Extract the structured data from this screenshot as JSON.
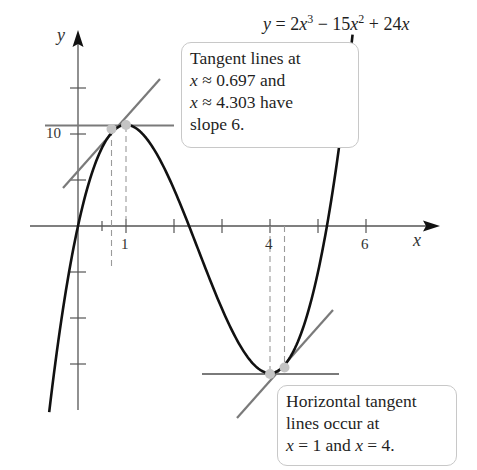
{
  "chart_data": {
    "type": "line",
    "equation_display": {
      "prefix": "y = 2x",
      "exp1": "3",
      "mid": " − 15x",
      "exp2": "2",
      "suffix": " + 24x"
    },
    "xlabel": "x",
    "ylabel": "y",
    "xlim": [
      -1,
      7.3
    ],
    "ylim": [
      -20,
      21
    ],
    "x_ticks": [
      0.5,
      1,
      2,
      3,
      4,
      5,
      6
    ],
    "x_tick_labels": [
      {
        "value": 1,
        "label": "1"
      },
      {
        "value": 4,
        "label": "4"
      },
      {
        "value": 6,
        "label": "6"
      }
    ],
    "y_ticks": [
      -15,
      -10,
      -5,
      5,
      10,
      15
    ],
    "y_tick_labels": [
      {
        "value": 10,
        "label": "10"
      }
    ],
    "grid": false,
    "series": [
      {
        "name": "y = 2x^3 - 15x^2 + 24x",
        "function": "2x^3 - 15x^2 + 24x",
        "x_range": [
          -0.6,
          5.72
        ],
        "sample_points": [
          {
            "x": -0.5,
            "y": -16.0
          },
          {
            "x": 0,
            "y": 0
          },
          {
            "x": 0.5,
            "y": 8.5
          },
          {
            "x": 0.697,
            "y": 10.62
          },
          {
            "x": 1,
            "y": 11
          },
          {
            "x": 2,
            "y": 4
          },
          {
            "x": 3,
            "y": -9
          },
          {
            "x": 4,
            "y": -16
          },
          {
            "x": 4.303,
            "y": -15.38
          },
          {
            "x": 5,
            "y": -5
          },
          {
            "x": 5.5,
            "y": 11.0
          }
        ]
      }
    ],
    "tangent_lines": [
      {
        "name": "horizontal tangent at x=1",
        "slope": 0,
        "point": {
          "x": 1,
          "y": 11
        }
      },
      {
        "name": "horizontal tangent at x=4",
        "slope": 0,
        "point": {
          "x": 4,
          "y": -16
        }
      },
      {
        "name": "slope-6 tangent at x≈0.697",
        "slope": 6,
        "point": {
          "x": 0.697,
          "y": 10.62
        }
      },
      {
        "name": "slope-6 tangent at x≈4.303",
        "slope": 6,
        "point": {
          "x": 4.303,
          "y": -15.38
        }
      }
    ],
    "highlighted_points": [
      {
        "x": 0.697,
        "y": 10.62
      },
      {
        "x": 1,
        "y": 11
      },
      {
        "x": 4,
        "y": -16
      },
      {
        "x": 4.303,
        "y": -15.38
      }
    ],
    "annotations": [
      {
        "text": "Tangent lines at x ≈ 0.697 and x ≈ 4.303 have slope 6."
      },
      {
        "text": "Horizontal tangent lines occur at x = 1 and x = 4."
      }
    ]
  },
  "axes": {
    "x_label": "x",
    "y_label": "y",
    "tick_1": "1",
    "tick_4": "4",
    "tick_6": "6",
    "tick_10": "10"
  },
  "callout_top": {
    "line1": "Tangent lines at",
    "line2_var": "x",
    "line2_rest": " ≈ 0.697 and",
    "line3_var": "x",
    "line3_rest": " ≈ 4.303 have",
    "line4": "slope 6."
  },
  "callout_bottom": {
    "line1": "Horizontal tangent",
    "line2": "lines occur at",
    "line3_var1": "x",
    "line3_mid": " = 1 and ",
    "line3_var2": "x",
    "line3_end": " = 4."
  },
  "colors": {
    "curve": "#111111",
    "axis": "#555555",
    "tangent": "#7a7a7a",
    "point": "#c4c4c4",
    "dashed": "#9a9a9a",
    "callout_border": "#c8c8c8"
  }
}
